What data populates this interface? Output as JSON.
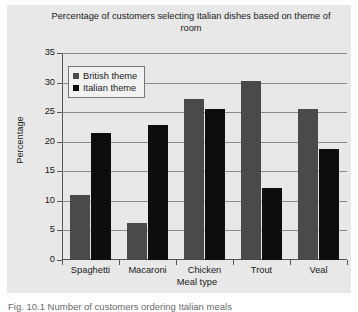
{
  "chart_data": {
    "type": "bar",
    "title": "Percentage of customers selecting Italian dishes based on theme of room",
    "xlabel": "Meal type",
    "ylabel": "Percentage",
    "categories": [
      "Spaghetti",
      "Macaroni",
      "Chicken",
      "Trout",
      "Veal"
    ],
    "series": [
      {
        "name": "British theme",
        "color": "#4a4a4a",
        "values": [
          11.0,
          6.3,
          27.3,
          30.2,
          25.6
        ]
      },
      {
        "name": "Italian theme",
        "color": "#0d0d0d",
        "values": [
          21.5,
          22.9,
          25.6,
          12.2,
          18.7
        ]
      }
    ],
    "ylim": [
      0,
      35
    ],
    "yticks": [
      0,
      5,
      10,
      15,
      20,
      25,
      30,
      35
    ],
    "ytick_labels": [
      "0",
      "5",
      "10",
      "15",
      "20",
      "25",
      "30",
      "35"
    ],
    "grid": true,
    "legend_position": "top-left-inside",
    "panel_background": "#e8e8e8"
  },
  "caption": "Fig. 10.1  Number of customers ordering Italian meals"
}
